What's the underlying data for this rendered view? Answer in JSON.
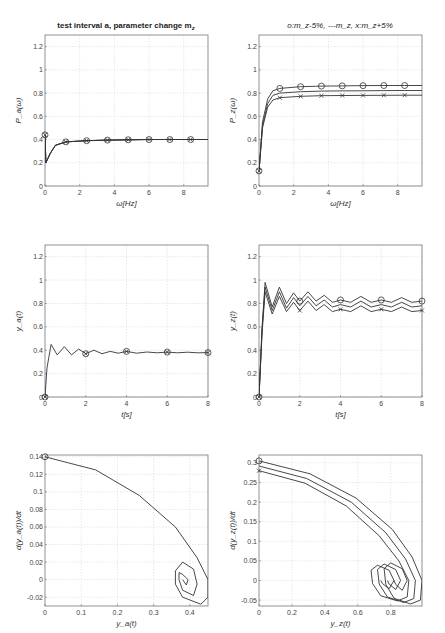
{
  "figure": {
    "left_title": "test interval a, parameter change m",
    "left_title_sub": "z",
    "right_title": "o:m",
    "right_title_full": "o:m_z-5%, ---m_z, x:m_z+5%"
  },
  "chart_data": [
    {
      "id": "p1",
      "type": "line",
      "title": "test interval a, parameter change m_z",
      "xlabel": "ω[Hz]",
      "ylabel": "P_a(ω)",
      "xlim": [
        0,
        9.4
      ],
      "ylim": [
        0,
        1.3
      ],
      "xticks": [
        0,
        2,
        4,
        6,
        8
      ],
      "yticks": [
        0,
        0.2,
        0.4,
        0.6,
        0.8,
        1,
        1.2
      ],
      "grid": true,
      "series": [
        {
          "name": "m_z-5%",
          "marker": "o",
          "x": [
            0,
            0.05,
            0.3,
            0.6,
            1.2,
            2.4,
            3.6,
            4.8,
            6.0,
            7.2,
            8.4,
            9.4
          ],
          "y": [
            0.44,
            0.2,
            0.28,
            0.35,
            0.38,
            0.39,
            0.395,
            0.398,
            0.4,
            0.4,
            0.4,
            0.4
          ]
        },
        {
          "name": "m_z",
          "marker": "none",
          "x": [
            0,
            0.05,
            0.3,
            0.6,
            1.2,
            2.4,
            3.6,
            4.8,
            6.0,
            7.2,
            8.4,
            9.4
          ],
          "y": [
            0.44,
            0.2,
            0.28,
            0.35,
            0.38,
            0.39,
            0.395,
            0.398,
            0.4,
            0.4,
            0.4,
            0.4
          ]
        },
        {
          "name": "m_z+5%",
          "marker": "x",
          "x": [
            0,
            0.05,
            0.3,
            0.6,
            1.2,
            2.4,
            3.6,
            4.8,
            6.0,
            7.2,
            8.4,
            9.4
          ],
          "y": [
            0.44,
            0.2,
            0.28,
            0.35,
            0.38,
            0.39,
            0.395,
            0.398,
            0.4,
            0.4,
            0.4,
            0.4
          ]
        }
      ]
    },
    {
      "id": "p2",
      "type": "line",
      "title": "o:m_z-5%, ---m_z, x:m_z+5%",
      "xlabel": "ω[Hz]",
      "ylabel": "P_z(ω)",
      "xlim": [
        0,
        9.4
      ],
      "ylim": [
        0,
        1.3
      ],
      "xticks": [
        0,
        2,
        4,
        6,
        8
      ],
      "yticks": [
        0,
        0.2,
        0.4,
        0.6,
        0.8,
        1,
        1.2
      ],
      "grid": true,
      "series": [
        {
          "name": "m_z-5%",
          "marker": "o",
          "x": [
            0,
            0.2,
            0.5,
            0.8,
            1.2,
            2.4,
            3.6,
            4.8,
            6.0,
            7.2,
            8.4,
            9.4
          ],
          "y": [
            0.13,
            0.55,
            0.75,
            0.82,
            0.84,
            0.855,
            0.86,
            0.862,
            0.864,
            0.865,
            0.865,
            0.865
          ]
        },
        {
          "name": "m_z",
          "marker": "none",
          "x": [
            0,
            0.2,
            0.5,
            0.8,
            1.2,
            2.4,
            3.6,
            4.8,
            6.0,
            7.2,
            8.4,
            9.4
          ],
          "y": [
            0.13,
            0.52,
            0.71,
            0.78,
            0.8,
            0.812,
            0.817,
            0.819,
            0.82,
            0.821,
            0.822,
            0.822
          ]
        },
        {
          "name": "m_z+5%",
          "marker": "x",
          "x": [
            0,
            0.2,
            0.5,
            0.8,
            1.2,
            2.4,
            3.6,
            4.8,
            6.0,
            7.2,
            8.4,
            9.4
          ],
          "y": [
            0.13,
            0.5,
            0.68,
            0.74,
            0.76,
            0.772,
            0.777,
            0.779,
            0.78,
            0.781,
            0.782,
            0.782
          ]
        }
      ]
    },
    {
      "id": "p3",
      "type": "line",
      "title": "",
      "xlabel": "t[s]",
      "ylabel": "y_a(t)",
      "xlim": [
        0,
        8
      ],
      "ylim": [
        0,
        1.3
      ],
      "xticks": [
        0,
        2,
        4,
        6,
        8
      ],
      "yticks": [
        0,
        0.2,
        0.4,
        0.6,
        0.8,
        1,
        1.2
      ],
      "grid": true,
      "series": [
        {
          "name": "m_z (all variants overlap)",
          "marker": "o/x",
          "x": [
            0,
            0.1,
            0.3,
            0.6,
            0.95,
            1.3,
            1.65,
            2.0,
            2.4,
            2.8,
            3.2,
            3.6,
            4.0,
            4.5,
            5,
            5.5,
            6,
            6.5,
            7,
            7.5,
            8
          ],
          "y": [
            0,
            0.25,
            0.45,
            0.36,
            0.43,
            0.36,
            0.41,
            0.37,
            0.4,
            0.37,
            0.39,
            0.375,
            0.39,
            0.375,
            0.385,
            0.378,
            0.384,
            0.378,
            0.383,
            0.378,
            0.38
          ]
        }
      ]
    },
    {
      "id": "p4",
      "type": "line",
      "title": "",
      "xlabel": "t[s]",
      "ylabel": "y_z(t)",
      "xlim": [
        0,
        8
      ],
      "ylim": [
        0,
        1.3
      ],
      "xticks": [
        0,
        2,
        4,
        6,
        8
      ],
      "yticks": [
        0,
        0.2,
        0.4,
        0.6,
        0.8,
        1,
        1.2
      ],
      "grid": true,
      "series": [
        {
          "name": "m_z-5%",
          "marker": "o",
          "x": [
            0,
            0.15,
            0.3,
            0.65,
            1.0,
            1.35,
            1.7,
            2.0,
            2.4,
            2.8,
            3.2,
            3.6,
            4.0,
            4.5,
            5,
            5.5,
            6,
            6.5,
            7,
            7.5,
            8
          ],
          "y": [
            0,
            0.6,
            0.98,
            0.77,
            0.94,
            0.8,
            0.89,
            0.82,
            0.9,
            0.82,
            0.87,
            0.81,
            0.83,
            0.81,
            0.86,
            0.81,
            0.83,
            0.81,
            0.85,
            0.81,
            0.82
          ]
        },
        {
          "name": "m_z",
          "marker": "none",
          "x": [
            0,
            0.15,
            0.3,
            0.65,
            1.0,
            1.35,
            1.7,
            2.0,
            2.4,
            2.8,
            3.2,
            3.6,
            4.0,
            4.5,
            5,
            5.5,
            6,
            6.5,
            7,
            7.5,
            8
          ],
          "y": [
            0,
            0.58,
            0.94,
            0.74,
            0.9,
            0.76,
            0.85,
            0.78,
            0.86,
            0.78,
            0.83,
            0.77,
            0.79,
            0.77,
            0.82,
            0.77,
            0.79,
            0.77,
            0.81,
            0.77,
            0.78
          ]
        },
        {
          "name": "m_z+5%",
          "marker": "x",
          "x": [
            0,
            0.15,
            0.3,
            0.65,
            1.0,
            1.35,
            1.7,
            2.0,
            2.4,
            2.8,
            3.2,
            3.6,
            4.0,
            4.5,
            5,
            5.5,
            6,
            6.5,
            7,
            7.5,
            8
          ],
          "y": [
            0,
            0.55,
            0.9,
            0.71,
            0.86,
            0.73,
            0.81,
            0.74,
            0.82,
            0.74,
            0.79,
            0.73,
            0.75,
            0.73,
            0.78,
            0.73,
            0.75,
            0.73,
            0.77,
            0.73,
            0.74
          ]
        }
      ]
    },
    {
      "id": "p5",
      "type": "line",
      "title": "",
      "xlabel": "y_a(t)",
      "ylabel": "d(y_a(t))/dt",
      "xlim": [
        0,
        0.45
      ],
      "ylim": [
        -0.03,
        0.142
      ],
      "xticks": [
        0,
        0.1,
        0.2,
        0.3,
        0.4
      ],
      "yticks": [
        -0.02,
        0,
        0.02,
        0.04,
        0.06,
        0.08,
        0.1,
        0.12,
        0.14
      ],
      "grid": true,
      "series": [
        {
          "name": "phase portrait",
          "marker": "o start",
          "x": [
            0,
            0.14,
            0.26,
            0.36,
            0.42,
            0.45,
            0.45,
            0.43,
            0.38,
            0.36,
            0.36,
            0.38,
            0.41,
            0.42,
            0.41,
            0.38,
            0.37,
            0.37,
            0.38,
            0.395,
            0.39,
            0.38
          ],
          "y": [
            0.14,
            0.125,
            0.096,
            0.06,
            0.025,
            0.0,
            -0.02,
            -0.028,
            -0.02,
            -0.005,
            0.01,
            0.02,
            0.012,
            -0.005,
            -0.018,
            -0.012,
            0.0,
            0.008,
            0.006,
            0.0,
            -0.006,
            0.0
          ]
        }
      ]
    },
    {
      "id": "p6",
      "type": "line",
      "title": "",
      "xlabel": "y_z(t)",
      "ylabel": "d(y_z(t))/dt",
      "xlim": [
        0,
        0.99
      ],
      "ylim": [
        -0.065,
        0.32
      ],
      "xticks": [
        0,
        0.2,
        0.4,
        0.6,
        0.8
      ],
      "yticks": [
        -0.05,
        0,
        0.05,
        0.1,
        0.15,
        0.2,
        0.25,
        0.3
      ],
      "grid": true,
      "series": [
        {
          "name": "m_z-5%",
          "marker": "o",
          "x": [
            0,
            0.31,
            0.59,
            0.81,
            0.93,
            0.99,
            0.98,
            0.92,
            0.82,
            0.77,
            0.76,
            0.8,
            0.87,
            0.9,
            0.87,
            0.83,
            0.82
          ],
          "y": [
            0.305,
            0.272,
            0.21,
            0.13,
            0.06,
            0.0,
            -0.05,
            -0.06,
            -0.045,
            -0.01,
            0.03,
            0.045,
            0.03,
            0.0,
            -0.025,
            -0.01,
            0.0
          ]
        },
        {
          "name": "m_z",
          "marker": "none",
          "x": [
            0,
            0.29,
            0.56,
            0.77,
            0.89,
            0.95,
            0.94,
            0.88,
            0.78,
            0.73,
            0.72,
            0.76,
            0.83,
            0.86,
            0.83,
            0.79,
            0.78
          ],
          "y": [
            0.292,
            0.26,
            0.2,
            0.122,
            0.055,
            0.0,
            -0.046,
            -0.056,
            -0.042,
            -0.009,
            0.028,
            0.042,
            0.028,
            0.0,
            -0.023,
            -0.009,
            0.0
          ]
        },
        {
          "name": "m_z+5%",
          "marker": "x",
          "x": [
            0,
            0.28,
            0.53,
            0.73,
            0.85,
            0.91,
            0.9,
            0.84,
            0.74,
            0.69,
            0.68,
            0.72,
            0.79,
            0.82,
            0.79,
            0.75,
            0.74
          ],
          "y": [
            0.28,
            0.248,
            0.19,
            0.114,
            0.05,
            0.0,
            -0.042,
            -0.052,
            -0.039,
            -0.008,
            0.026,
            0.039,
            0.026,
            0.0,
            -0.021,
            -0.008,
            0.0
          ]
        }
      ]
    }
  ]
}
